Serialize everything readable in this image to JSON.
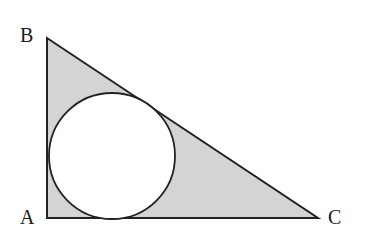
{
  "diagram": {
    "type": "geometry",
    "vertices": {
      "A": {
        "label": "A",
        "x": 47,
        "y": 218
      },
      "B": {
        "label": "B",
        "x": 47,
        "y": 38
      },
      "C": {
        "label": "C",
        "x": 318,
        "y": 218
      }
    },
    "circle": {
      "cx": 112,
      "cy": 156,
      "r": 63
    },
    "colors": {
      "shade": "#d4d4d4",
      "stroke": "#222222",
      "circle_fill": "#ffffff"
    }
  }
}
